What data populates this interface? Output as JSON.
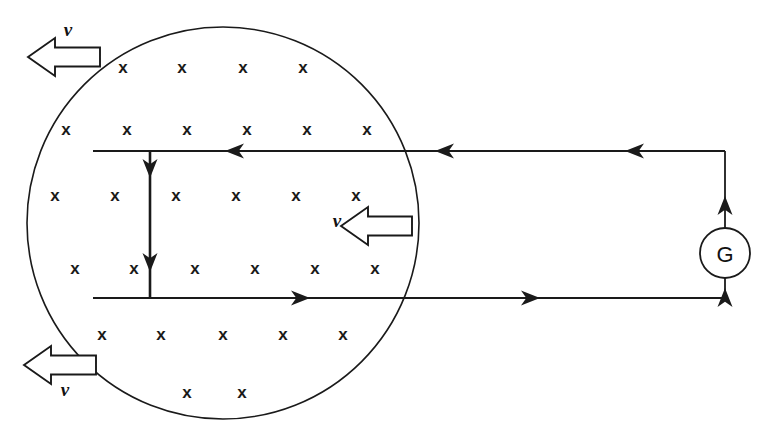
{
  "figure": {
    "background_color": "#ffffff",
    "ink_color": "#1a1a1a",
    "width": 778,
    "height": 439
  },
  "field_region": {
    "name": "magnetic-field-region",
    "shape": "circle",
    "center_x": 223,
    "center_y": 223,
    "radius": 196,
    "field_symbol": "x",
    "field_direction_meaning": "into the page",
    "x_marks": [
      {
        "x": 123,
        "y": 69,
        "label": "x"
      },
      {
        "x": 182,
        "y": 69,
        "label": "x"
      },
      {
        "x": 243,
        "y": 69,
        "label": "x"
      },
      {
        "x": 303,
        "y": 69,
        "label": "x"
      },
      {
        "x": 66,
        "y": 131,
        "label": "x"
      },
      {
        "x": 127,
        "y": 131,
        "label": "x"
      },
      {
        "x": 187,
        "y": 131,
        "label": "x"
      },
      {
        "x": 247,
        "y": 131,
        "label": "x"
      },
      {
        "x": 307,
        "y": 131,
        "label": "x"
      },
      {
        "x": 367,
        "y": 131,
        "label": "x"
      },
      {
        "x": 55,
        "y": 197,
        "label": "x"
      },
      {
        "x": 115,
        "y": 197,
        "label": "x"
      },
      {
        "x": 176,
        "y": 197,
        "label": "x"
      },
      {
        "x": 236,
        "y": 197,
        "label": "x"
      },
      {
        "x": 296,
        "y": 197,
        "label": "x"
      },
      {
        "x": 356,
        "y": 197,
        "label": "x"
      },
      {
        "x": 75,
        "y": 270,
        "label": "x"
      },
      {
        "x": 134,
        "y": 270,
        "label": "x"
      },
      {
        "x": 195,
        "y": 270,
        "label": "x"
      },
      {
        "x": 255,
        "y": 270,
        "label": "x"
      },
      {
        "x": 315,
        "y": 270,
        "label": "x"
      },
      {
        "x": 375,
        "y": 270,
        "label": "x"
      },
      {
        "x": 102,
        "y": 336,
        "label": "x"
      },
      {
        "x": 161,
        "y": 336,
        "label": "x"
      },
      {
        "x": 223,
        "y": 336,
        "label": "x"
      },
      {
        "x": 283,
        "y": 336,
        "label": "x"
      },
      {
        "x": 343,
        "y": 336,
        "label": "x"
      },
      {
        "x": 187,
        "y": 394,
        "label": "x"
      },
      {
        "x": 242,
        "y": 394,
        "label": "x"
      }
    ]
  },
  "circuit": {
    "top_rail": {
      "name": "top-rail-wire",
      "x1": 93,
      "y1": 151,
      "x2": 725,
      "y2": 151,
      "current_direction": "leftward"
    },
    "bottom_rail": {
      "name": "bottom-rail-wire",
      "x1": 93,
      "y1": 298,
      "x2": 725,
      "y2": 298,
      "current_direction": "rightward"
    },
    "right_link_top": {
      "name": "right-wire-upper",
      "x1": 725,
      "y1": 151,
      "x2": 725,
      "y2": 228
    },
    "right_link_bottom": {
      "name": "right-wire-lower",
      "x1": 725,
      "y1": 278,
      "x2": 725,
      "y2": 298
    },
    "sliding_rod": {
      "name": "sliding-conductor-rod",
      "x": 150,
      "y1": 151,
      "y2": 298,
      "current_direction": "downward"
    },
    "current_arrowheads": [
      {
        "name": "current-arrow-top-inner",
        "x": 225,
        "y": 151,
        "direction": "left"
      },
      {
        "name": "current-arrow-top-mid",
        "x": 435,
        "y": 151,
        "direction": "left"
      },
      {
        "name": "current-arrow-top-outer",
        "x": 625,
        "y": 151,
        "direction": "left"
      },
      {
        "name": "current-arrow-bottom-inner",
        "x": 310,
        "y": 298,
        "direction": "right"
      },
      {
        "name": "current-arrow-bottom-outer",
        "x": 540,
        "y": 298,
        "direction": "right"
      },
      {
        "name": "current-arrow-rod-upper",
        "x": 150,
        "y": 178,
        "direction": "down"
      },
      {
        "name": "current-arrow-rod-lower",
        "x": 150,
        "y": 272,
        "direction": "down"
      },
      {
        "name": "current-arrow-right-upper",
        "x": 725,
        "y": 196,
        "direction": "up"
      },
      {
        "name": "current-arrow-right-lower",
        "x": 725,
        "y": 288,
        "direction": "up"
      }
    ]
  },
  "galvanometer": {
    "name": "galvanometer",
    "label": "G",
    "center_x": 725,
    "center_y": 253,
    "radius": 25
  },
  "velocity_arrows": [
    {
      "name": "velocity-arrow-top-left",
      "label": "v",
      "direction": "left",
      "tip_x": 28,
      "tail_x": 100,
      "center_y": 57,
      "label_x": 68,
      "label_y": 32
    },
    {
      "name": "velocity-arrow-middle",
      "label": "v",
      "direction": "left",
      "tip_x": 341,
      "tail_x": 412,
      "center_y": 226,
      "label_x": 337,
      "label_y": 223
    },
    {
      "name": "velocity-arrow-bottom-left",
      "label": "v",
      "direction": "left",
      "tip_x": 24,
      "tail_x": 96,
      "center_y": 365,
      "label_x": 65,
      "label_y": 392
    }
  ],
  "chart_data": {
    "type": "diagram",
    "elements": [
      "magnetic field circle with x symbols (B into page)",
      "horizontal conducting rails (top and bottom)",
      "sliding vertical rod with downward current",
      "galvanometer G in right branch",
      "three hollow velocity arrows labelled v pointing left"
    ]
  }
}
